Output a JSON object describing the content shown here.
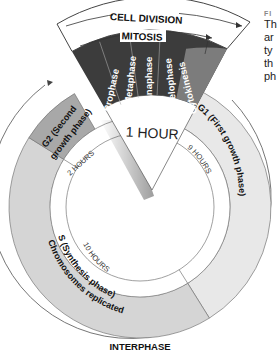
{
  "figure": {
    "caption_label": "FI",
    "caption_lines": [
      "Th",
      "ar",
      "ty",
      "th",
      "ph"
    ]
  },
  "cycle": {
    "outer_label": "INTERPHASE",
    "banner": {
      "cell_division": "CELL DIVISION",
      "mitosis": "MITOSIS"
    },
    "mitosis_phases": [
      "Prophase",
      "Metaphase",
      "Anaphase",
      "Telophase",
      "Cytokinesis"
    ],
    "center_duration": "1 HOUR",
    "phases": [
      {
        "id": "g1",
        "label": "G1 (First growth phase)",
        "duration": "9 HOURS",
        "color": "#e6e6e6"
      },
      {
        "id": "s",
        "label_line1": "S (Synthesis phase)",
        "label_line2": "Chromosomes replicated",
        "duration": "10 HOURS",
        "color": "#d4d4d4"
      },
      {
        "id": "g2",
        "label_line1": "G2 (Second",
        "label_line2": "growth phase)",
        "duration": "2 HOURS",
        "color": "#a9a9a9"
      }
    ],
    "colors": {
      "mitosis_band": "#3c3c3c",
      "cytokinesis_band": "#7a7a7a",
      "outline": "#555555"
    }
  }
}
